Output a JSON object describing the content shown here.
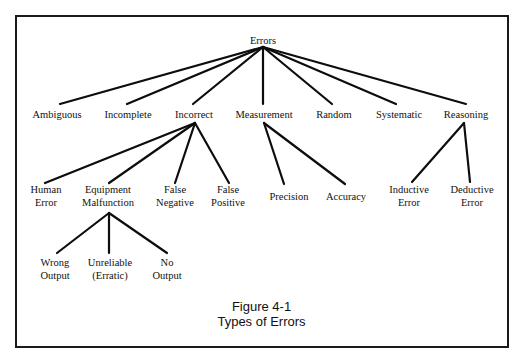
{
  "figure": {
    "number_label": "Figure 4-1",
    "title": "Types of Errors"
  },
  "tree": {
    "root": {
      "id": "errors",
      "label": "Errors",
      "x": 263,
      "y": 40,
      "anchor_bottom": [
        263,
        47
      ]
    },
    "level1": [
      {
        "id": "ambiguous",
        "label": "Ambiguous",
        "x": 57,
        "y": 114,
        "anchor_top": [
          60,
          104
        ]
      },
      {
        "id": "incomplete",
        "label": "Incomplete",
        "x": 128,
        "y": 114,
        "anchor_top": [
          127,
          104
        ]
      },
      {
        "id": "incorrect",
        "label": "Incorrect",
        "x": 194,
        "y": 114,
        "anchor_top": [
          193,
          104
        ],
        "anchor_bottom": [
          195,
          123
        ]
      },
      {
        "id": "measurement",
        "label": "Measurement",
        "x": 264,
        "y": 114,
        "anchor_top": [
          263,
          104
        ],
        "anchor_bottom": [
          264,
          123
        ]
      },
      {
        "id": "random",
        "label": "Random",
        "x": 334,
        "y": 114,
        "anchor_top": [
          332,
          104
        ]
      },
      {
        "id": "systematic",
        "label": "Systematic",
        "x": 399,
        "y": 114,
        "anchor_top": [
          396,
          104
        ]
      },
      {
        "id": "reasoning",
        "label": "Reasoning",
        "x": 466,
        "y": 114,
        "anchor_top": [
          466,
          104
        ],
        "anchor_bottom": [
          464,
          123
        ]
      }
    ],
    "incorrect_children": [
      {
        "id": "human-error",
        "line1": "Human",
        "line2": "Error",
        "x": 46,
        "y": 196,
        "anchor_top": [
          45,
          183
        ]
      },
      {
        "id": "equipment-malfunction",
        "line1": "Equipment",
        "line2": "Malfunction",
        "x": 108,
        "y": 196,
        "anchor_top": [
          109,
          183
        ],
        "anchor_bottom": [
          109,
          213
        ]
      },
      {
        "id": "false-negative",
        "line1": "False",
        "line2": "Negative",
        "x": 175,
        "y": 196,
        "anchor_top": [
          175,
          183
        ]
      },
      {
        "id": "false-positive",
        "line1": "False",
        "line2": "Positive",
        "x": 228,
        "y": 196,
        "anchor_top": [
          229,
          183
        ]
      }
    ],
    "measurement_children": [
      {
        "id": "precision",
        "label": "Precision",
        "x": 289,
        "y": 196,
        "anchor_top": [
          284,
          184
        ]
      },
      {
        "id": "accuracy",
        "label": "Accuracy",
        "x": 346,
        "y": 196,
        "anchor_top": [
          345,
          184
        ]
      }
    ],
    "reasoning_children": [
      {
        "id": "inductive-error",
        "line1": "Inductive",
        "line2": "Error",
        "x": 409,
        "y": 196,
        "anchor_top": [
          412,
          182
        ]
      },
      {
        "id": "deductive-error",
        "line1": "Deductive",
        "line2": "Error",
        "x": 472,
        "y": 196,
        "anchor_top": [
          470,
          182
        ]
      }
    ],
    "equipment_children": [
      {
        "id": "wrong-output",
        "line1": "Wrong",
        "line2": "Output",
        "x": 55,
        "y": 269,
        "anchor_top": [
          57,
          253
        ]
      },
      {
        "id": "unreliable-erratic",
        "line1": "Unreliable",
        "line2": "(Erratic)",
        "x": 110,
        "y": 269,
        "anchor_top": [
          109,
          253
        ]
      },
      {
        "id": "no-output",
        "line1": "No",
        "line2": "Output",
        "x": 167,
        "y": 269,
        "anchor_top": [
          167,
          253
        ]
      }
    ]
  },
  "style": {
    "line_color": "#0d0d0d",
    "text_color": "#111111",
    "frame_color": "#1a1a1a",
    "background": "#ffffff"
  }
}
